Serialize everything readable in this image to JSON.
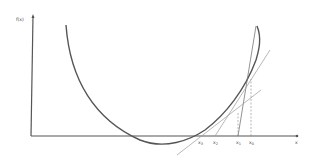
{
  "diagram": {
    "y_axis_label": "f(x)",
    "x_axis_label": "x",
    "iterates": [
      {
        "base": "x",
        "sub": "3",
        "x": 200
      },
      {
        "base": "x",
        "sub": "2",
        "x": 215
      },
      {
        "base": "x",
        "sub": "1",
        "x": 238
      },
      {
        "base": "x",
        "sub": "0",
        "x": 251
      }
    ],
    "colors": {
      "curve": "#555555",
      "axes": "#555555",
      "tangent": "#999999",
      "dashed": "#888888",
      "label": "#444444"
    }
  }
}
